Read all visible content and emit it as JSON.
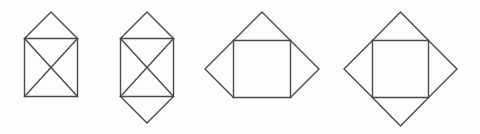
{
  "page": {
    "width": 480,
    "height": 134,
    "background_color": "#fdfdfd",
    "stroke_color": "#4a4a4a",
    "stroke_width": 1.4,
    "fill": "none"
  },
  "figures": [
    {
      "id": "figure-1",
      "name": "square-with-x-and-top-triangle",
      "label": "Square with inscribed X and one triangle on top",
      "triangle_count": 1,
      "has_inner_x": true,
      "square": {
        "left": 24.5,
        "top": 38.5,
        "right": 77.5,
        "bottom": 96.5
      },
      "paths": [
        {
          "name": "square-outline",
          "d": "M 24.5 38.5 L 77.5 38.5 L 77.5 96.5 L 24.5 96.5 Z"
        },
        {
          "name": "diagonal-top-left-to-bottom-right",
          "d": "M 24.5 38.5 L 77.5 96.5"
        },
        {
          "name": "diagonal-top-right-to-bottom-left",
          "d": "M 77.5 38.5 L 24.5 96.5"
        },
        {
          "name": "top-triangle",
          "d": "M 24.5 38.5 L 51 12 L 77.5 38.5"
        }
      ]
    },
    {
      "id": "figure-2",
      "name": "square-with-x-and-top-bottom-triangles",
      "label": "Square with inscribed X and triangles on top and bottom",
      "triangle_count": 2,
      "has_inner_x": true,
      "square": {
        "left": 120.5,
        "top": 38.5,
        "right": 173.5,
        "bottom": 96.5
      },
      "paths": [
        {
          "name": "square-outline",
          "d": "M 120.5 38.5 L 173.5 38.5 L 173.5 96.5 L 120.5 96.5 Z"
        },
        {
          "name": "diagonal-top-left-to-bottom-right",
          "d": "M 120.5 38.5 L 173.5 96.5"
        },
        {
          "name": "diagonal-top-right-to-bottom-left",
          "d": "M 173.5 38.5 L 120.5 96.5"
        },
        {
          "name": "top-triangle",
          "d": "M 120.5 38.5 L 147 12 L 173.5 38.5"
        },
        {
          "name": "bottom-triangle",
          "d": "M 120.5 96.5 L 147 123 L 173.5 96.5"
        }
      ]
    },
    {
      "id": "figure-3",
      "name": "square-with-three-triangles",
      "label": "Square with triangles on top, left and right sides",
      "triangle_count": 3,
      "has_inner_x": false,
      "square": {
        "left": 233.5,
        "top": 40.5,
        "right": 290.5,
        "bottom": 97.5
      },
      "paths": [
        {
          "name": "square-outline",
          "d": "M 233.5 40.5 L 290.5 40.5 L 290.5 97.5 L 233.5 97.5 Z"
        },
        {
          "name": "top-triangle",
          "d": "M 233.5 40.5 L 262 12 L 290.5 40.5"
        },
        {
          "name": "left-triangle",
          "d": "M 233.5 40.5 L 205 69 L 233.5 97.5"
        },
        {
          "name": "right-triangle",
          "d": "M 290.5 40.5 L 319 69 L 290.5 97.5"
        }
      ]
    },
    {
      "id": "figure-4",
      "name": "square-with-four-triangles-diamond",
      "label": "Square with triangles on all four sides forming a diamond",
      "triangle_count": 4,
      "has_inner_x": false,
      "square": {
        "left": 372.5,
        "top": 40.5,
        "right": 428.5,
        "bottom": 97.5
      },
      "paths": [
        {
          "name": "square-outline",
          "d": "M 372.5 40.5 L 428.5 40.5 L 428.5 97.5 L 372.5 97.5 Z"
        },
        {
          "name": "top-triangle",
          "d": "M 372.5 40.5 L 400.5 12 L 428.5 40.5"
        },
        {
          "name": "left-triangle",
          "d": "M 372.5 40.5 L 344 69 L 372.5 97.5"
        },
        {
          "name": "right-triangle",
          "d": "M 428.5 40.5 L 457 69 L 428.5 97.5"
        },
        {
          "name": "bottom-triangle",
          "d": "M 372.5 97.5 L 400.5 126 L 428.5 97.5"
        }
      ]
    }
  ]
}
